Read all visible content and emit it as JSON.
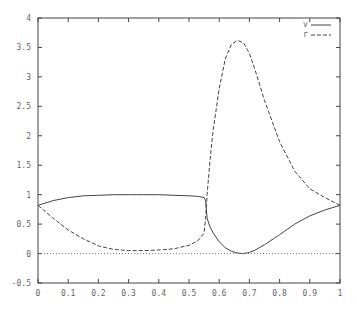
{
  "chart_data": {
    "type": "line",
    "title": "",
    "xlabel": "",
    "ylabel": "",
    "xlim": [
      0,
      1
    ],
    "ylim": [
      -0.5,
      4
    ],
    "grid": false,
    "legend_position": "top-right",
    "x_ticks": [
      "0",
      "0.1",
      "0.2",
      "0.3",
      "0.4",
      "0.5",
      "0.6",
      "0.7",
      "0.8",
      "0.9",
      "1"
    ],
    "y_ticks": [
      "-0.5",
      "0",
      "0.5",
      "1",
      "1.5",
      "2",
      "2.5",
      "3",
      "3.5",
      "4"
    ],
    "series": [
      {
        "name": "v",
        "style": "solid",
        "x": [
          0,
          0.05,
          0.1,
          0.15,
          0.2,
          0.25,
          0.3,
          0.35,
          0.4,
          0.45,
          0.5,
          0.53,
          0.55,
          0.555,
          0.56,
          0.57,
          0.58,
          0.6,
          0.62,
          0.64,
          0.66,
          0.68,
          0.7,
          0.72,
          0.75,
          0.8,
          0.85,
          0.9,
          0.95,
          1.0
        ],
        "values": [
          0.82,
          0.9,
          0.95,
          0.98,
          0.99,
          1.0,
          1.0,
          1.0,
          1.0,
          0.99,
          0.98,
          0.97,
          0.95,
          0.9,
          0.6,
          0.45,
          0.35,
          0.2,
          0.1,
          0.04,
          0.01,
          0.0,
          0.02,
          0.06,
          0.15,
          0.32,
          0.5,
          0.64,
          0.74,
          0.82
        ]
      },
      {
        "name": "r",
        "style": "dashed",
        "x": [
          0,
          0.05,
          0.1,
          0.15,
          0.2,
          0.25,
          0.3,
          0.35,
          0.4,
          0.45,
          0.5,
          0.53,
          0.55,
          0.555,
          0.56,
          0.57,
          0.58,
          0.6,
          0.62,
          0.64,
          0.66,
          0.68,
          0.7,
          0.72,
          0.75,
          0.8,
          0.85,
          0.9,
          0.95,
          1.0
        ],
        "values": [
          0.82,
          0.6,
          0.4,
          0.25,
          0.13,
          0.07,
          0.05,
          0.05,
          0.06,
          0.08,
          0.14,
          0.22,
          0.35,
          0.6,
          1.0,
          1.6,
          2.1,
          2.8,
          3.3,
          3.55,
          3.62,
          3.58,
          3.4,
          3.1,
          2.6,
          1.9,
          1.4,
          1.1,
          0.95,
          0.82
        ]
      },
      {
        "name": "zero",
        "style": "dotted",
        "x": [
          0,
          1
        ],
        "values": [
          0,
          0
        ]
      }
    ]
  },
  "legend": {
    "items": [
      {
        "label": "v",
        "style": "solid"
      },
      {
        "label": "r",
        "style": "dashed"
      }
    ]
  }
}
